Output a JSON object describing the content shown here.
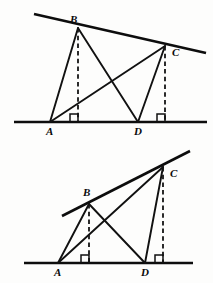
{
  "canvas": {
    "width": 213,
    "height": 283,
    "background": "#fdfdfc"
  },
  "style": {
    "line_color": "#111111",
    "heavy_line_color": "#0d0d0d",
    "label_color": "#0a0a0a",
    "baseline_width": 2.6,
    "slant_width": 2.6,
    "side_width": 1.9,
    "dash_pattern": "4.5 3.2"
  },
  "figures": [
    {
      "id": "figure-top",
      "caption": "",
      "points": {
        "A": {
          "x": 50,
          "y": 122,
          "label": "A",
          "label_x": 46,
          "label_y": 135
        },
        "B": {
          "x": 78,
          "y": 28,
          "label": "B",
          "label_x": 70,
          "label_y": 23
        },
        "C": {
          "x": 165,
          "y": 46,
          "label": "C",
          "label_x": 172,
          "label_y": 56
        },
        "D": {
          "x": 138,
          "y": 122,
          "label": "D",
          "label_x": 134,
          "label_y": 135
        },
        "Bfoot": {
          "x": 78,
          "y": 122
        },
        "Cfoot": {
          "x": 165,
          "y": 122
        }
      },
      "baseline": {
        "x1": 14,
        "y1": 122,
        "x2": 207,
        "y2": 122
      },
      "slantline": {
        "x1": 34,
        "y1": 14,
        "x2": 206,
        "y2": 53
      },
      "segments": [
        {
          "name": "AB",
          "x1": 50,
          "y1": 122,
          "x2": 78,
          "y2": 28
        },
        {
          "name": "BD",
          "x1": 78,
          "y1": 28,
          "x2": 138,
          "y2": 122
        },
        {
          "name": "AC",
          "x1": 50,
          "y1": 122,
          "x2": 165,
          "y2": 46
        },
        {
          "name": "DC",
          "x1": 138,
          "y1": 122,
          "x2": 165,
          "y2": 46
        }
      ],
      "altitudes": [
        {
          "name": "B-altitude",
          "x1": 78,
          "y1": 28,
          "x2": 78,
          "y2": 122
        },
        {
          "name": "C-altitude",
          "x1": 165,
          "y1": 46,
          "x2": 165,
          "y2": 122
        }
      ],
      "right_angles": [
        {
          "name": "right-angle-B-foot",
          "x": 78,
          "y": 122,
          "size": 8
        },
        {
          "name": "right-angle-C-foot",
          "x": 165,
          "y": 122,
          "size": 8
        }
      ]
    },
    {
      "id": "figure-bottom",
      "caption": "",
      "points": {
        "A": {
          "x": 58,
          "y": 263,
          "label": "A",
          "label_x": 54,
          "label_y": 276
        },
        "B": {
          "x": 89,
          "y": 204,
          "label": "B",
          "label_x": 83,
          "label_y": 196
        },
        "C": {
          "x": 163,
          "y": 167,
          "label": "C",
          "label_x": 170,
          "label_y": 177
        },
        "D": {
          "x": 145,
          "y": 263,
          "label": "D",
          "label_x": 141,
          "label_y": 276
        },
        "Bfoot": {
          "x": 89,
          "y": 263
        },
        "Cfoot": {
          "x": 163,
          "y": 263
        }
      },
      "baseline": {
        "x1": 24,
        "y1": 263,
        "x2": 193,
        "y2": 263
      },
      "slantline": {
        "x1": 62,
        "y1": 216,
        "x2": 190,
        "y2": 151
      },
      "segments": [
        {
          "name": "AB",
          "x1": 58,
          "y1": 263,
          "x2": 89,
          "y2": 204
        },
        {
          "name": "BD",
          "x1": 89,
          "y1": 204,
          "x2": 145,
          "y2": 263
        },
        {
          "name": "AC",
          "x1": 58,
          "y1": 263,
          "x2": 163,
          "y2": 167
        },
        {
          "name": "DC",
          "x1": 145,
          "y1": 263,
          "x2": 163,
          "y2": 167
        }
      ],
      "altitudes": [
        {
          "name": "B-altitude",
          "x1": 89,
          "y1": 204,
          "x2": 89,
          "y2": 263
        },
        {
          "name": "C-altitude",
          "x1": 163,
          "y1": 167,
          "x2": 163,
          "y2": 263
        }
      ],
      "right_angles": [
        {
          "name": "right-angle-B-foot",
          "x": 89,
          "y": 263,
          "size": 8
        },
        {
          "name": "right-angle-C-foot",
          "x": 163,
          "y": 263,
          "size": 8
        }
      ]
    }
  ]
}
